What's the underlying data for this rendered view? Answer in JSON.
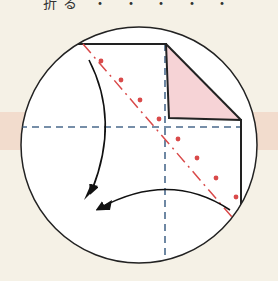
{
  "header": {
    "title_cropped": "折る ・ ・ ・ ・ ・"
  },
  "diagram": {
    "type": "origami-fold-step",
    "colors": {
      "background": "#f5f1e6",
      "band": "#f2dccd",
      "circle_fill": "#ffffff",
      "outline": "#222222",
      "valley_fold_line": "#4a6a8c",
      "mountain_fold_line": "#d94a4a",
      "folded_flap": "#f6d3d6"
    },
    "elements": [
      "magnified-circle-view",
      "paper-outline",
      "folded-corner-triangle",
      "vertical-crease-dashed",
      "horizontal-crease-dashed",
      "diagonal-fold-line-dash-dot",
      "fold-arrow-left",
      "fold-arrow-bottom"
    ]
  }
}
